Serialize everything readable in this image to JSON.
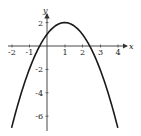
{
  "chart_data": {
    "type": "line",
    "title": "",
    "xlabel": "x",
    "ylabel": "y",
    "function": "y = -(x - 1)^2 + 2",
    "x": [
      -2,
      -1.5,
      -1,
      -0.5,
      0,
      0.5,
      1,
      1.5,
      2,
      2.5,
      3,
      3.5,
      4
    ],
    "series": [
      {
        "name": "parabola",
        "values": [
          -7,
          -4.25,
          -2,
          -0.25,
          1,
          1.75,
          2,
          1.75,
          1,
          -0.25,
          -2,
          -4.25,
          -7
        ]
      }
    ],
    "vertex": [
      1,
      2
    ],
    "x_intercepts": [
      -0.41,
      2.41
    ],
    "y_intercept": 1,
    "xticks": [
      "-2",
      "-1",
      "1",
      "2",
      "3",
      "4"
    ],
    "yticks": [
      "2",
      "-2",
      "-4",
      "-6"
    ],
    "xlim": [
      -2,
      4
    ],
    "ylim": [
      -7,
      2.5
    ],
    "grid": false,
    "legend": null,
    "colors": {
      "curve": "#1a1a1a",
      "axis": "#333333"
    }
  }
}
